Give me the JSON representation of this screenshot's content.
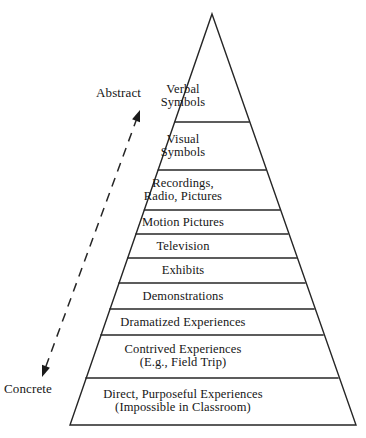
{
  "diagram": {
    "type": "pyramid",
    "tier_count": 10,
    "background_color": "#ffffff",
    "stroke_color": "#262626",
    "text_color": "#161616",
    "apex": {
      "x": 212,
      "y": 14
    },
    "base": {
      "left_x": 70,
      "right_x": 356,
      "y": 425
    },
    "tiers": [
      {
        "index": 1,
        "label": "Verbal\nSymbols",
        "name": "verbal-symbols",
        "top_y": 14,
        "bottom_y": 122,
        "text_center_y": 96,
        "font_size": 12.5
      },
      {
        "index": 2,
        "label": "Visual\nSymbols",
        "name": "visual-symbols",
        "top_y": 122,
        "bottom_y": 170,
        "text_center_y": 146,
        "font_size": 12.5
      },
      {
        "index": 3,
        "label": "Recordings,\nRadio, Pictures",
        "name": "recordings-radio-pictures",
        "top_y": 170,
        "bottom_y": 210,
        "text_center_y": 190,
        "font_size": 12.5
      },
      {
        "index": 4,
        "label": "Motion Pictures",
        "name": "motion-pictures",
        "top_y": 210,
        "bottom_y": 234,
        "text_center_y": 222,
        "font_size": 12.5
      },
      {
        "index": 5,
        "label": "Television",
        "name": "television",
        "top_y": 234,
        "bottom_y": 258,
        "text_center_y": 246,
        "font_size": 12.5
      },
      {
        "index": 6,
        "label": "Exhibits",
        "name": "exhibits",
        "top_y": 258,
        "bottom_y": 283,
        "text_center_y": 270,
        "font_size": 12.5
      },
      {
        "index": 7,
        "label": "Demonstrations",
        "name": "demonstrations",
        "top_y": 283,
        "bottom_y": 309,
        "text_center_y": 296,
        "font_size": 12.5
      },
      {
        "index": 8,
        "label": "Dramatized Experiences",
        "name": "dramatized-experiences",
        "top_y": 309,
        "bottom_y": 335,
        "text_center_y": 322,
        "font_size": 12.5
      },
      {
        "index": 9,
        "label": "Contrived Experiences\n(E.g., Field Trip)",
        "name": "contrived-experiences",
        "top_y": 335,
        "bottom_y": 378,
        "text_center_y": 356,
        "font_size": 12.5
      },
      {
        "index": 10,
        "label": "Direct, Purposeful Experiences\n(Impossible in Classroom)",
        "name": "direct-purposeful-experiences",
        "top_y": 378,
        "bottom_y": 425,
        "text_center_y": 401,
        "font_size": 12.5
      }
    ],
    "axis_arrow": {
      "name": "abstraction-axis",
      "style": "dashed-double-headed",
      "start": {
        "x": 42,
        "y": 377
      },
      "end": {
        "x": 140,
        "y": 110
      },
      "top_label": "Abstract",
      "bottom_label": "Concrete",
      "top_label_pos": {
        "x": 96,
        "y": 85
      },
      "bottom_label_pos": {
        "x": 4,
        "y": 381
      },
      "label_font_size": 13
    }
  }
}
